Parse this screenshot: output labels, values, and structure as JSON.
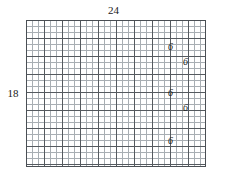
{
  "figure": {
    "type": "graph-paper-rectangle",
    "background_color": "#ffffff",
    "grid": {
      "cols": 30,
      "rows": 24,
      "cell_px": 6,
      "major_every": 3,
      "minor_line_color": "#a8aeb3",
      "major_line_color": "#555a5f",
      "border_color": "#4a4f54",
      "left_px": 26,
      "top_px": 20,
      "width_px": 180,
      "height_px": 147
    },
    "dimensions": {
      "top_label": "24",
      "left_label": "18"
    },
    "segment_labels": [
      {
        "text": "6",
        "left_px": 168,
        "top_px": 42
      },
      {
        "text": "6",
        "left_px": 183,
        "top_px": 57
      },
      {
        "text": "6",
        "left_px": 168,
        "top_px": 88
      },
      {
        "text": "6",
        "left_px": 183,
        "top_px": 103
      },
      {
        "text": "6",
        "left_px": 168,
        "top_px": 136
      }
    ]
  }
}
